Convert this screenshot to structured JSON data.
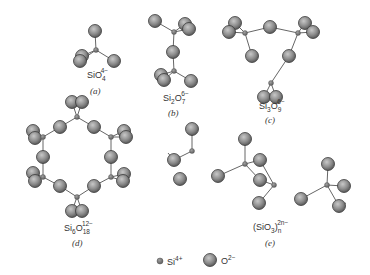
{
  "colors": {
    "oxygen_fill": "#8c8c8c",
    "oxygen_stroke": "#3a3a3a",
    "silicon_fill": "#7a7a7a",
    "bond": "#666666",
    "text": "#333333"
  },
  "structures": [
    {
      "id": "a",
      "caption": "(a)",
      "formula": {
        "base": "SiO",
        "sub": "4",
        "sup": "4−"
      }
    },
    {
      "id": "b",
      "caption": "(b)",
      "formula": {
        "base": "Si",
        "sub1": "2",
        "mid": "O",
        "sub": "7",
        "sup": "6−"
      }
    },
    {
      "id": "c",
      "caption": "(c)",
      "formula": {
        "base": "Si",
        "sub1": "3",
        "mid": "O",
        "sub": "9",
        "sup": "6−"
      }
    },
    {
      "id": "d",
      "caption": "(d)",
      "formula": {
        "base": "Si",
        "sub1": "6",
        "mid": "O",
        "sub": "18",
        "sup": "12−"
      }
    },
    {
      "id": "e",
      "caption": "(e)",
      "formula": {
        "base": "(SiO",
        "sub1": "3",
        "mid": ")",
        "sub": "n",
        "sup": "2n−"
      }
    }
  ],
  "legend": {
    "silicon_label": "Si",
    "silicon_charge": "4+",
    "oxygen_label": "O",
    "oxygen_charge": "2−"
  }
}
